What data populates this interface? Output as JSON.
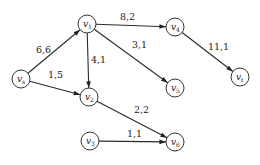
{
  "diagram": {
    "type": "directed network flow graph",
    "edge_label_format": "capacity,flow",
    "nodes": [
      {
        "id": "vs",
        "base": "v",
        "sub": "s",
        "x": 21,
        "y": 79
      },
      {
        "id": "v1",
        "base": "v",
        "sub": "1",
        "x": 87,
        "y": 24
      },
      {
        "id": "v2",
        "base": "v",
        "sub": "2",
        "x": 89,
        "y": 97
      },
      {
        "id": "v3",
        "base": "v",
        "sub": "3",
        "x": 90,
        "y": 141
      },
      {
        "id": "v4",
        "base": "v",
        "sub": "4",
        "x": 175,
        "y": 27
      },
      {
        "id": "v5",
        "base": "v",
        "sub": "5",
        "x": 175,
        "y": 88
      },
      {
        "id": "v6",
        "base": "v",
        "sub": "6",
        "x": 175,
        "y": 142
      },
      {
        "id": "vt",
        "base": "v",
        "sub": "t",
        "x": 240,
        "y": 77
      }
    ],
    "edges": [
      {
        "from": "vs",
        "to": "v1",
        "label": "6,6",
        "lx": 36,
        "ly": 53
      },
      {
        "from": "vs",
        "to": "v2",
        "label": "1,5",
        "lx": 48,
        "ly": 78
      },
      {
        "from": "v1",
        "to": "v2",
        "label": "4,1",
        "lx": 91,
        "ly": 63
      },
      {
        "from": "v1",
        "to": "v4",
        "label": "8,2",
        "lx": 120,
        "ly": 20
      },
      {
        "from": "v1",
        "to": "v5",
        "label": "3,1",
        "lx": 132,
        "ly": 48
      },
      {
        "from": "v4",
        "to": "vt",
        "label": "11,1",
        "lx": 208,
        "ly": 50
      },
      {
        "from": "v2",
        "to": "v6",
        "label": "2,2",
        "lx": 134,
        "ly": 113
      },
      {
        "from": "v3",
        "to": "v6",
        "label": "1,1",
        "lx": 127,
        "ly": 137
      }
    ]
  }
}
